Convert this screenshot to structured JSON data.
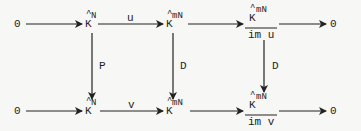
{
  "diagram": {
    "type": "commutative-diagram",
    "top_row": {
      "start": "0",
      "n1": {
        "base": "K",
        "hat": "^",
        "sup": "N"
      },
      "n2": {
        "base": "K",
        "hat": "^",
        "sup": "mN"
      },
      "n3": {
        "num_base": "K",
        "num_hat": "^",
        "num_sup": "mN",
        "den": "im u"
      },
      "end": "0",
      "arrow_labels": {
        "n1_n2": "u"
      }
    },
    "bottom_row": {
      "start": "0",
      "n1": {
        "base": "K",
        "hat": "^",
        "sup": "N"
      },
      "n2": {
        "base": "K",
        "hat": "^",
        "sup": "mN"
      },
      "n3": {
        "num_base": "K",
        "num_hat": "^",
        "num_sup": "mN",
        "den": "im v"
      },
      "end": "0",
      "arrow_labels": {
        "n1_n2": "v"
      }
    },
    "vertical_labels": {
      "col1": "P",
      "col2": "D",
      "col3": "D"
    },
    "colors": {
      "ink": "#222222",
      "background": "#f7f7f5"
    }
  }
}
